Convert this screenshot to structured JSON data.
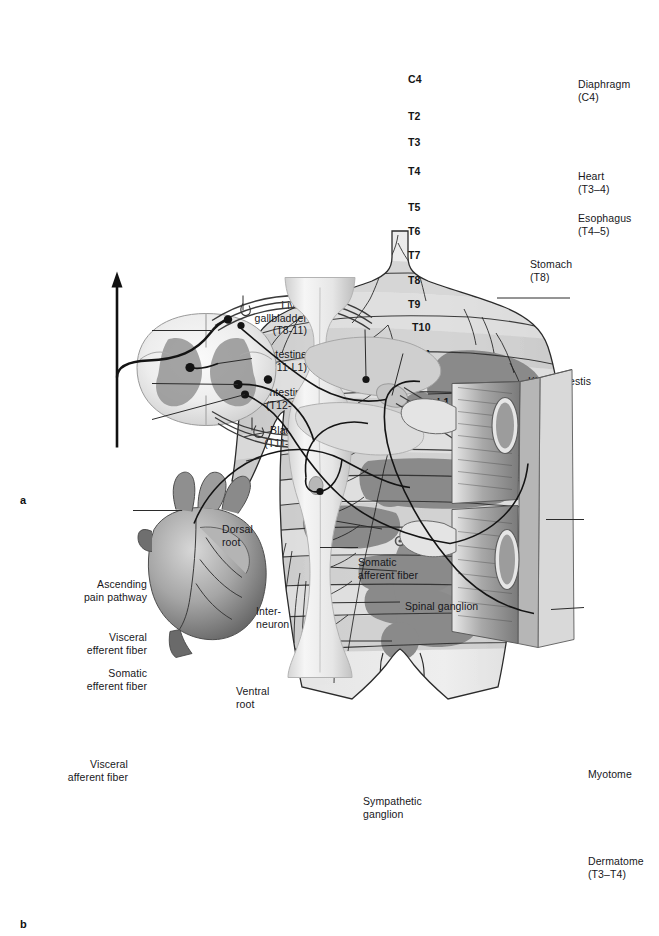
{
  "figure": {
    "panels": [
      {
        "id": "a",
        "letter": "a",
        "caption": "Referred pain zones (Head zones) on the trunk"
      },
      {
        "id": "b",
        "letter": "b",
        "caption": "Neuroanatomic basis of referred pain"
      }
    ]
  },
  "panel_a": {
    "letter": "a",
    "dermatome_labels": [
      {
        "text": "C4",
        "x": 408,
        "y": 80
      },
      {
        "text": "T2",
        "x": 408,
        "y": 117
      },
      {
        "text": "T3",
        "x": 408,
        "y": 143
      },
      {
        "text": "T4",
        "x": 408,
        "y": 172
      },
      {
        "text": "T5",
        "x": 408,
        "y": 208
      },
      {
        "text": "T6",
        "x": 408,
        "y": 232
      },
      {
        "text": "T7",
        "x": 408,
        "y": 256
      },
      {
        "text": "T8",
        "x": 408,
        "y": 281
      },
      {
        "text": "T9",
        "x": 408,
        "y": 305
      },
      {
        "text": "T10",
        "x": 412,
        "y": 328
      },
      {
        "text": "T11",
        "x": 413,
        "y": 355
      },
      {
        "text": "T12",
        "x": 413,
        "y": 382
      },
      {
        "text": "L1",
        "x": 437,
        "y": 403
      }
    ],
    "right_labels": [
      {
        "name": "diaphragm",
        "line1": "Diaphragm",
        "line2": "(C4)",
        "x": 578,
        "y": 78,
        "lead_from_x": 570,
        "lead_from_y": 85,
        "lead_to_x": 497,
        "lead_to_y": 85
      },
      {
        "name": "heart",
        "line1": "Heart",
        "line2": "(T3–4)",
        "x": 578,
        "y": 170,
        "lead_from_x": 570,
        "lead_from_y": 177,
        "lead_to_x": 428,
        "lead_to_y": 181
      },
      {
        "name": "esophagus",
        "line1": "Esophagus",
        "line2": "(T4–5)",
        "x": 578,
        "y": 212,
        "lead_from_x": 570,
        "lead_from_y": 219,
        "lead_to_x": 398,
        "lead_to_y": 193
      },
      {
        "name": "stomach",
        "line1": "Stomach",
        "line2": "(T8)",
        "x": 530,
        "y": 258,
        "lead_from_x": 522,
        "lead_from_y": 265,
        "lead_to_x": 470,
        "lead_to_y": 262
      },
      {
        "name": "kidney-testis",
        "line1": "Kidney, testis",
        "line2": "(T10–L1)",
        "x": 528,
        "y": 375,
        "lead_from_x": 520,
        "lead_from_y": 382,
        "lead_to_x": 463,
        "lead_to_y": 385
      }
    ],
    "left_labels": [
      {
        "name": "liver-gallbladder",
        "line1": "Liver,",
        "line2": "gallbladder",
        "line3": "(T8-11)",
        "x": 307,
        "y": 299,
        "lead_from_x": 312,
        "lead_from_y": 304,
        "lead_to_x": 382,
        "lead_to_y": 316
      },
      {
        "name": "small-intestine",
        "line1": "Small intestine",
        "line2": "(T11-L1)",
        "line3": "",
        "x": 307,
        "y": 348,
        "lead_from_x": 312,
        "lead_from_y": 353,
        "lead_to_x": 397,
        "lead_to_y": 358
      },
      {
        "name": "large-intestine",
        "line1": "Large intestine",
        "line2": "(T12-L1)",
        "line3": "",
        "x": 307,
        "y": 386,
        "lead_from_x": 312,
        "lead_from_y": 390,
        "lead_to_x": 400,
        "lead_to_y": 389
      },
      {
        "name": "bladder",
        "line1": "Bladder",
        "line2": "(T11–L1)",
        "line3": "",
        "x": 307,
        "y": 424,
        "lead_from_x": 312,
        "lead_from_y": 428,
        "lead_to_x": 392,
        "lead_to_y": 428
      }
    ]
  },
  "panel_b": {
    "letter": "b",
    "labels": [
      {
        "name": "ascending-pain-pathway",
        "line1": "Ascending",
        "line2": "pain pathway",
        "align": "right",
        "x": 147,
        "y": 578,
        "lead_from_x": 152,
        "lead_from_y": 583,
        "lead_to_x": 213,
        "lead_to_y": 583
      },
      {
        "name": "visceral-efferent-fiber",
        "line1": "Visceral",
        "line2": "efferent fiber",
        "align": "right",
        "x": 147,
        "y": 631,
        "lead_from_x": 152,
        "lead_from_y": 636,
        "lead_to_x": 238,
        "lead_to_y": 637
      },
      {
        "name": "somatic-efferent-fiber",
        "line1": "Somatic",
        "line2": "efferent fiber",
        "align": "right",
        "x": 147,
        "y": 667,
        "lead_from_x": 152,
        "lead_from_y": 672,
        "lead_to_x": 245,
        "lead_to_y": 647
      },
      {
        "name": "visceral-afferent-fiber",
        "line1": "Visceral",
        "line2": "afferent fiber",
        "align": "right",
        "x": 128,
        "y": 758,
        "lead_from_x": 133,
        "lead_from_y": 763,
        "lead_to_x": 182,
        "lead_to_y": 763
      },
      {
        "name": "dorsal-root",
        "line1": "Dorsal",
        "line2": "root",
        "align": "left",
        "x": 222,
        "y": 523,
        "lead_from_x": 243,
        "lead_from_y": 548,
        "lead_to_x": 243,
        "lead_to_y": 563
      },
      {
        "name": "interneuron",
        "line1": "Inter-",
        "line2": "neuron",
        "align": "left",
        "x": 256,
        "y": 605,
        "lead_from_x": 252,
        "lead_from_y": 611,
        "lead_to_x": 218,
        "lead_to_y": 616
      },
      {
        "name": "ventral-root",
        "line1": "Ventral",
        "line2": "root",
        "align": "left",
        "x": 236,
        "y": 685,
        "lead_from_x": 252,
        "lead_from_y": 683,
        "lead_to_x": 252,
        "lead_to_y": 670
      },
      {
        "name": "somatic-afferent-fiber",
        "line1": "Somatic",
        "line2": "afferent fiber",
        "align": "left",
        "x": 358,
        "y": 556,
        "lead_from_x": 365,
        "lead_from_y": 582,
        "lead_to_x": 366,
        "lead_to_y": 630
      },
      {
        "name": "spinal-ganglion",
        "line1": "Spinal ganglion",
        "line2": "",
        "align": "left",
        "x": 405,
        "y": 600,
        "lead_from_x": 403,
        "lead_from_y": 606,
        "lead_to_x": 392,
        "lead_to_y": 648
      },
      {
        "name": "sympathetic-ganglion",
        "line1": "Sympathetic",
        "line2": "ganglion",
        "align": "left",
        "x": 363,
        "y": 795,
        "lead_from_x": 358,
        "lead_from_y": 800,
        "lead_to_x": 320,
        "lead_to_y": 800
      },
      {
        "name": "myotome",
        "line1": "Myotome",
        "line2": "",
        "align": "left",
        "x": 588,
        "y": 768,
        "lead_from_x": 584,
        "lead_from_y": 772,
        "lead_to_x": 546,
        "lead_to_y": 772
      },
      {
        "name": "dermatome",
        "line1": "Dermatome",
        "line2": "(T3–T4)",
        "align": "left",
        "x": 588,
        "y": 855,
        "lead_from_x": 584,
        "lead_from_y": 860,
        "lead_to_x": 551,
        "lead_to_y": 862
      }
    ]
  },
  "colors": {
    "skin_light": "#e8e8e8",
    "skin_mid": "#d2d2d2",
    "band_light": "#cfcfcf",
    "band_mid": "#b4b4b4",
    "band_dark": "#8f8f8f",
    "zone_dark": "#8a8a8a",
    "outline": "#2b2b2b",
    "text": "#17171b",
    "leader": "#2b2b2b",
    "background": "#ffffff"
  }
}
